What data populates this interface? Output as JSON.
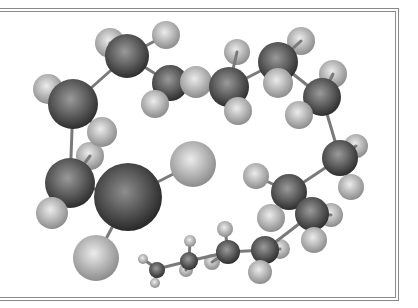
{
  "figure": {
    "colors": {
      "background": "#ffffff",
      "frame": "#8a8a8a",
      "carbon_light": "#9a9a9a",
      "carbon_dark": "#2e2e2e",
      "hydrogen_light": "#e8e8e8",
      "hydrogen_dark": "#8c8c8c",
      "heavy_light": "#8e8e8e",
      "heavy_dark": "#262626",
      "bond": "#7a7a7a"
    },
    "frame": {
      "top_y": [
        8,
        11
      ],
      "right_x": [
        395,
        398
      ],
      "bottom_y": [
        297,
        300
      ]
    }
  },
  "molecule": {
    "bonds": [
      [
        127,
        56,
        73,
        104
      ],
      [
        127,
        56,
        170,
        83
      ],
      [
        170,
        83,
        229,
        87
      ],
      [
        229,
        87,
        278,
        62
      ],
      [
        278,
        62,
        322,
        97
      ],
      [
        322,
        97,
        340,
        158
      ],
      [
        340,
        158,
        289,
        192
      ],
      [
        289,
        192,
        312,
        214
      ],
      [
        312,
        214,
        265,
        250
      ],
      [
        265,
        250,
        228,
        252
      ],
      [
        228,
        252,
        189,
        261
      ],
      [
        189,
        261,
        157,
        269
      ],
      [
        73,
        104,
        70,
        183
      ],
      [
        70,
        183,
        128,
        197
      ],
      [
        128,
        197,
        193,
        164
      ],
      [
        128,
        197,
        96,
        258
      ],
      [
        127,
        56,
        110,
        43
      ],
      [
        127,
        56,
        166,
        35
      ],
      [
        73,
        104,
        48,
        89
      ],
      [
        73,
        104,
        102,
        132
      ],
      [
        170,
        83,
        196,
        82
      ],
      [
        170,
        83,
        155,
        104
      ],
      [
        229,
        87,
        237,
        52
      ],
      [
        229,
        87,
        238,
        111
      ],
      [
        278,
        62,
        301,
        41
      ],
      [
        278,
        62,
        278,
        83
      ],
      [
        322,
        97,
        333,
        74
      ],
      [
        322,
        97,
        299,
        115
      ],
      [
        340,
        158,
        356,
        146
      ],
      [
        340,
        158,
        351,
        187
      ],
      [
        289,
        192,
        256,
        176
      ],
      [
        289,
        192,
        271,
        218
      ],
      [
        312,
        214,
        331,
        215
      ],
      [
        312,
        214,
        314,
        240
      ],
      [
        265,
        250,
        260,
        272
      ],
      [
        265,
        250,
        280,
        249
      ],
      [
        228,
        252,
        225,
        229
      ],
      [
        228,
        252,
        212,
        262
      ],
      [
        189,
        261,
        190,
        241
      ],
      [
        189,
        261,
        186,
        270
      ],
      [
        157,
        269,
        143,
        259
      ],
      [
        157,
        269,
        155,
        283
      ],
      [
        70,
        183,
        52,
        213
      ],
      [
        70,
        183,
        90,
        156
      ]
    ],
    "atoms_back": [
      {
        "type": "H",
        "x": 110,
        "y": 43,
        "r": 15
      },
      {
        "type": "H",
        "x": 237,
        "y": 52,
        "r": 13
      },
      {
        "type": "H",
        "x": 301,
        "y": 41,
        "r": 14
      },
      {
        "type": "H",
        "x": 333,
        "y": 74,
        "r": 14
      },
      {
        "type": "H",
        "x": 356,
        "y": 146,
        "r": 12
      },
      {
        "type": "H",
        "x": 331,
        "y": 215,
        "r": 12
      },
      {
        "type": "H",
        "x": 90,
        "y": 156,
        "r": 14
      },
      {
        "type": "H",
        "x": 280,
        "y": 249,
        "r": 10
      },
      {
        "type": "H",
        "x": 212,
        "y": 262,
        "r": 8
      },
      {
        "type": "H",
        "x": 186,
        "y": 270,
        "r": 7
      }
    ],
    "atoms": [
      {
        "type": "C",
        "x": 127,
        "y": 56,
        "r": 22
      },
      {
        "type": "H",
        "x": 166,
        "y": 35,
        "r": 14
      },
      {
        "type": "C",
        "x": 170,
        "y": 83,
        "r": 18
      },
      {
        "type": "H",
        "x": 196,
        "y": 82,
        "r": 16
      },
      {
        "type": "H",
        "x": 155,
        "y": 104,
        "r": 14
      },
      {
        "type": "H",
        "x": 48,
        "y": 89,
        "r": 15
      },
      {
        "type": "C",
        "x": 73,
        "y": 104,
        "r": 25
      },
      {
        "type": "H",
        "x": 102,
        "y": 132,
        "r": 15
      },
      {
        "type": "C",
        "x": 229,
        "y": 87,
        "r": 20
      },
      {
        "type": "H",
        "x": 238,
        "y": 111,
        "r": 14
      },
      {
        "type": "C",
        "x": 278,
        "y": 62,
        "r": 20
      },
      {
        "type": "H",
        "x": 278,
        "y": 83,
        "r": 15
      },
      {
        "type": "C",
        "x": 322,
        "y": 97,
        "r": 19
      },
      {
        "type": "H",
        "x": 299,
        "y": 115,
        "r": 14
      },
      {
        "type": "C",
        "x": 340,
        "y": 158,
        "r": 18
      },
      {
        "type": "H",
        "x": 351,
        "y": 187,
        "r": 13
      },
      {
        "type": "H",
        "x": 256,
        "y": 176,
        "r": 13
      },
      {
        "type": "C",
        "x": 289,
        "y": 192,
        "r": 18
      },
      {
        "type": "H",
        "x": 271,
        "y": 218,
        "r": 14
      },
      {
        "type": "C",
        "x": 312,
        "y": 214,
        "r": 17
      },
      {
        "type": "H",
        "x": 314,
        "y": 240,
        "r": 13
      },
      {
        "type": "C",
        "x": 70,
        "y": 183,
        "r": 25
      },
      {
        "type": "H",
        "x": 52,
        "y": 213,
        "r": 16
      },
      {
        "type": "X",
        "x": 128,
        "y": 197,
        "r": 34
      },
      {
        "type": "H",
        "x": 193,
        "y": 164,
        "r": 23
      },
      {
        "type": "H",
        "x": 96,
        "y": 258,
        "r": 23
      },
      {
        "type": "C",
        "x": 265,
        "y": 250,
        "r": 14
      },
      {
        "type": "H",
        "x": 260,
        "y": 272,
        "r": 12
      },
      {
        "type": "H",
        "x": 225,
        "y": 229,
        "r": 8
      },
      {
        "type": "C",
        "x": 228,
        "y": 252,
        "r": 12
      },
      {
        "type": "H",
        "x": 190,
        "y": 241,
        "r": 6
      },
      {
        "type": "C",
        "x": 189,
        "y": 261,
        "r": 9
      },
      {
        "type": "H",
        "x": 143,
        "y": 259,
        "r": 5
      },
      {
        "type": "C",
        "x": 157,
        "y": 270,
        "r": 8
      },
      {
        "type": "H",
        "x": 155,
        "y": 283,
        "r": 5
      }
    ]
  }
}
